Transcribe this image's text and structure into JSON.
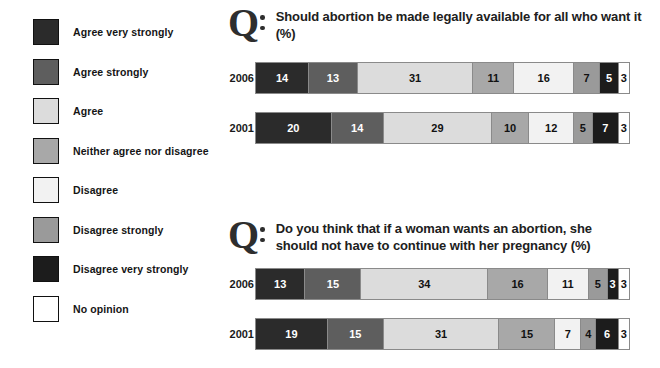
{
  "legend": {
    "items": [
      {
        "label": "Agree very strongly",
        "color": "#2b2b2b"
      },
      {
        "label": "Agree strongly",
        "color": "#5e5e5e"
      },
      {
        "label": "Agree",
        "color": "#dcdcdc"
      },
      {
        "label": "Neither agree nor disagree",
        "color": "#a8a8a8"
      },
      {
        "label": "Disagree",
        "color": "#f2f2f2"
      },
      {
        "label": "Disagree strongly",
        "color": "#9a9a9a"
      },
      {
        "label": "Disagree very strongly",
        "color": "#1c1c1c"
      },
      {
        "label": "No opinion",
        "color": "#ffffff"
      }
    ]
  },
  "questions": [
    {
      "marker": "Q",
      "text": "Should abortion be made legally available for all who want it (%)",
      "rows": [
        {
          "year": "2006",
          "values": [
            14,
            13,
            31,
            11,
            16,
            7,
            5,
            3
          ]
        },
        {
          "year": "2001",
          "values": [
            20,
            14,
            29,
            10,
            12,
            5,
            7,
            3
          ]
        }
      ]
    },
    {
      "marker": "Q",
      "text": "Do you think that if a woman wants an abortion, she should not have to continue with her pregnancy (%)",
      "rows": [
        {
          "year": "2006",
          "values": [
            13,
            15,
            34,
            16,
            11,
            5,
            3,
            3
          ]
        },
        {
          "year": "2001",
          "values": [
            19,
            15,
            31,
            15,
            7,
            4,
            6,
            3
          ]
        }
      ]
    }
  ],
  "chart_data": {
    "type": "bar",
    "orientation": "horizontal-stacked-100",
    "title": "",
    "xlabel": "Percent (%)",
    "ylabel": "",
    "xlim": [
      0,
      100
    ],
    "grid": false,
    "legend_position": "left",
    "categories": [
      "2006",
      "2001"
    ],
    "series_names": [
      "Agree very strongly",
      "Agree strongly",
      "Agree",
      "Neither agree nor disagree",
      "Disagree",
      "Disagree strongly",
      "Disagree very strongly",
      "No opinion"
    ],
    "series_colors": [
      "#2b2b2b",
      "#5e5e5e",
      "#dcdcdc",
      "#a8a8a8",
      "#f2f2f2",
      "#9a9a9a",
      "#1c1c1c",
      "#ffffff"
    ],
    "panels": [
      {
        "question": "Should abortion be made legally available for all who want it (%)",
        "series": [
          {
            "name": "Agree very strongly",
            "values": [
              14,
              20
            ]
          },
          {
            "name": "Agree strongly",
            "values": [
              13,
              14
            ]
          },
          {
            "name": "Agree",
            "values": [
              31,
              29
            ]
          },
          {
            "name": "Neither agree nor disagree",
            "values": [
              11,
              10
            ]
          },
          {
            "name": "Disagree",
            "values": [
              16,
              12
            ]
          },
          {
            "name": "Disagree strongly",
            "values": [
              7,
              5
            ]
          },
          {
            "name": "Disagree very strongly",
            "values": [
              5,
              7
            ]
          },
          {
            "name": "No opinion",
            "values": [
              3,
              3
            ]
          }
        ]
      },
      {
        "question": "Do you think that if a woman wants an abortion, she should not have to continue with her pregnancy (%)",
        "series": [
          {
            "name": "Agree very strongly",
            "values": [
              13,
              19
            ]
          },
          {
            "name": "Agree strongly",
            "values": [
              15,
              15
            ]
          },
          {
            "name": "Agree",
            "values": [
              34,
              31
            ]
          },
          {
            "name": "Neither agree nor disagree",
            "values": [
              16,
              15
            ]
          },
          {
            "name": "Disagree",
            "values": [
              11,
              7
            ]
          },
          {
            "name": "Disagree strongly",
            "values": [
              5,
              4
            ]
          },
          {
            "name": "Disagree very strongly",
            "values": [
              3,
              6
            ]
          },
          {
            "name": "No opinion",
            "values": [
              3,
              3
            ]
          }
        ]
      }
    ]
  }
}
